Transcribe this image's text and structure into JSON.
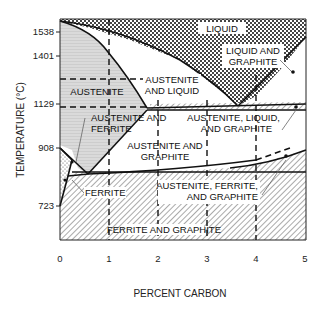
{
  "diagram": {
    "xaxis": {
      "label": "PERCENT CARBON",
      "ticks": [
        "0",
        "1",
        "2",
        "3",
        "4",
        "5"
      ]
    },
    "yaxis": {
      "label": "TEMPERATURE (°C)",
      "ticks": [
        "1538",
        "1401",
        "1129",
        "908",
        "723"
      ]
    },
    "regions": {
      "liquid": "LIQUID",
      "liquid_graphite_1": "LIQUID AND",
      "liquid_graphite_2": "GRAPHITE",
      "austenite": "AUSTENITE",
      "austenite_liquid_1": "AUSTENITE",
      "austenite_liquid_2": "AND LIQUID",
      "austenite_ferrite_1": "AUSTENITE AND",
      "austenite_ferrite_2": "FERRITE",
      "aus_liq_graph_1": "AUSTENITE, LIQUID,",
      "aus_liq_graph_2": "AND GRAPHITE",
      "austenite_graphite_1": "AUSTENITE AND",
      "austenite_graphite_2": "GRAPHITE",
      "ferrite": "FERRITE",
      "aus_fer_graph_1": "AUSTENITE, FERRITE,",
      "aus_fer_graph_2": "AND GRAPHITE",
      "ferrite_graphite": "FERRITE AND GRAPHITE"
    },
    "colors": {
      "line": "#111111",
      "austenite_fill": "#d9d9d9",
      "liquid_pattern": "#555555",
      "hatch": "#444444"
    }
  }
}
